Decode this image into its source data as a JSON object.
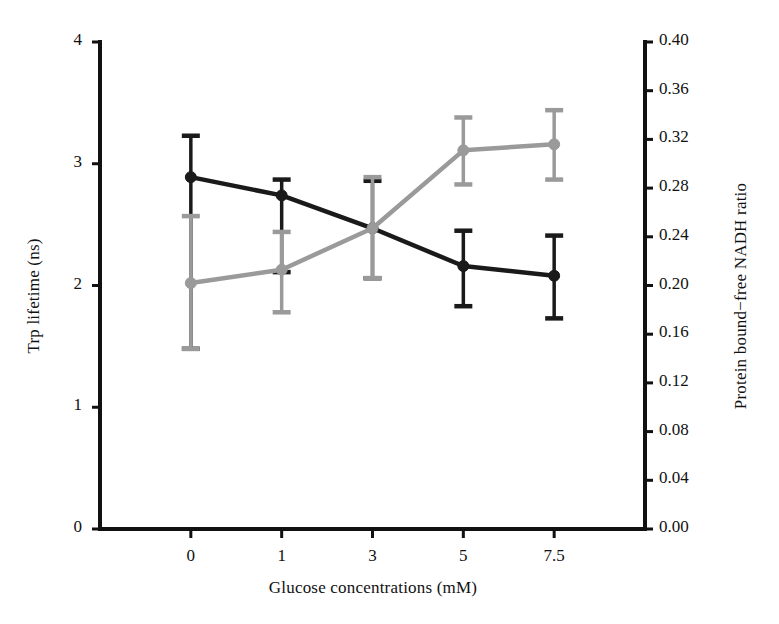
{
  "chart_data": {
    "type": "line",
    "title": "",
    "xlabel": "Glucose concentrations (mM)",
    "categories": [
      "0",
      "1",
      "3",
      "5",
      "7.5"
    ],
    "grid": false,
    "legend": "none",
    "axes": {
      "left": {
        "label": "Trp lifetime (ns)",
        "ticks": [
          "0",
          "1",
          "2",
          "3",
          "4"
        ],
        "tickvalues": [
          0,
          1,
          2,
          3,
          4
        ],
        "ylim": [
          0,
          4
        ]
      },
      "right": {
        "label": "Protein bound−free NADH ratio",
        "ticks": [
          "0.00",
          "0.04",
          "0.08",
          "0.12",
          "0.16",
          "0.20",
          "0.24",
          "0.28",
          "0.32",
          "0.36",
          "0.40"
        ],
        "tickvalues": [
          0.0,
          0.04,
          0.08,
          0.12,
          0.16,
          0.2,
          0.24,
          0.28,
          0.32,
          0.36,
          0.4
        ],
        "ylim": [
          0,
          0.4
        ]
      }
    },
    "series": [
      {
        "name": "Trp lifetime",
        "axis": "left",
        "color": "#1a1a1a",
        "marker": "circle",
        "values": [
          2.89,
          2.74,
          2.47,
          2.16,
          2.08
        ],
        "err_low": [
          1.48,
          2.11,
          2.06,
          1.83,
          1.73
        ],
        "err_high": [
          3.23,
          2.87,
          2.86,
          2.45,
          2.41
        ]
      },
      {
        "name": "Protein bound−free NADH ratio",
        "axis": "right",
        "color": "#9a9a9a",
        "marker": "circle",
        "values": [
          0.202,
          0.213,
          0.247,
          0.311,
          0.316
        ],
        "err_low": [
          0.148,
          0.178,
          0.206,
          0.283,
          0.287
        ],
        "err_high": [
          0.257,
          0.244,
          0.289,
          0.338,
          0.344
        ]
      }
    ]
  },
  "axis_titles": {
    "left": "Trp lifetime (ns)",
    "right": "Protein bound−free NADH ratio",
    "bottom": "Glucose concentrations (mM)"
  }
}
